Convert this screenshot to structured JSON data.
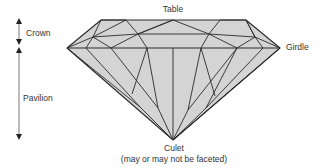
{
  "diagram": {
    "type": "gemstone-anatomy",
    "labels": {
      "table": "Table",
      "crown": "Crown",
      "girdle": "Girdle",
      "pavilion": "Pavilion",
      "culet": "Culet",
      "culet_note": "(may or may not be faceted)"
    },
    "colors": {
      "fill": "#d4d4d4",
      "stroke": "#2a2a2a",
      "text": "#333333",
      "arrow": "#555555"
    }
  }
}
